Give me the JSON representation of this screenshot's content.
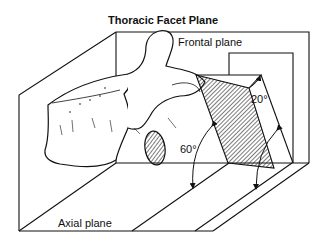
{
  "title": "Thoracic Facet Plane",
  "labels": {
    "frontal_plane": "Frontal plane",
    "axial_plane": "Axial plane",
    "angle_frontal": "20°",
    "angle_axial": "60°"
  },
  "figure": {
    "planes": [
      "Frontal plane",
      "Axial plane"
    ],
    "facet_plane_style": "diagonal hatching",
    "angles": [
      {
        "label": "20°",
        "relative_to": "Frontal plane"
      },
      {
        "label": "60°",
        "relative_to": "Axial plane"
      }
    ]
  }
}
